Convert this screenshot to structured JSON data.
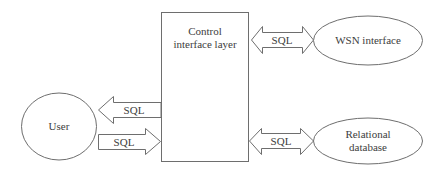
{
  "diagram": {
    "type": "block-diagram",
    "colors": {
      "background": "#ffffff",
      "stroke": "#6e6e6e",
      "text": "#3d3d3d"
    },
    "nodes": {
      "control": {
        "shape": "rectangle",
        "line1": "Control",
        "line2": "interface layer"
      },
      "wsn": {
        "shape": "ellipse",
        "label": "WSN interface"
      },
      "database": {
        "shape": "ellipse",
        "line1": "Relational",
        "line2": "database"
      },
      "user": {
        "shape": "ellipse",
        "label": "User"
      }
    },
    "edges": {
      "control_wsn": {
        "label": "SQL",
        "direction": "bidirectional"
      },
      "control_database": {
        "label": "SQL",
        "direction": "bidirectional"
      },
      "control_to_user": {
        "label": "SQL",
        "direction": "control-to-user"
      },
      "user_to_control": {
        "label": "SQL",
        "direction": "user-to-control"
      }
    }
  }
}
